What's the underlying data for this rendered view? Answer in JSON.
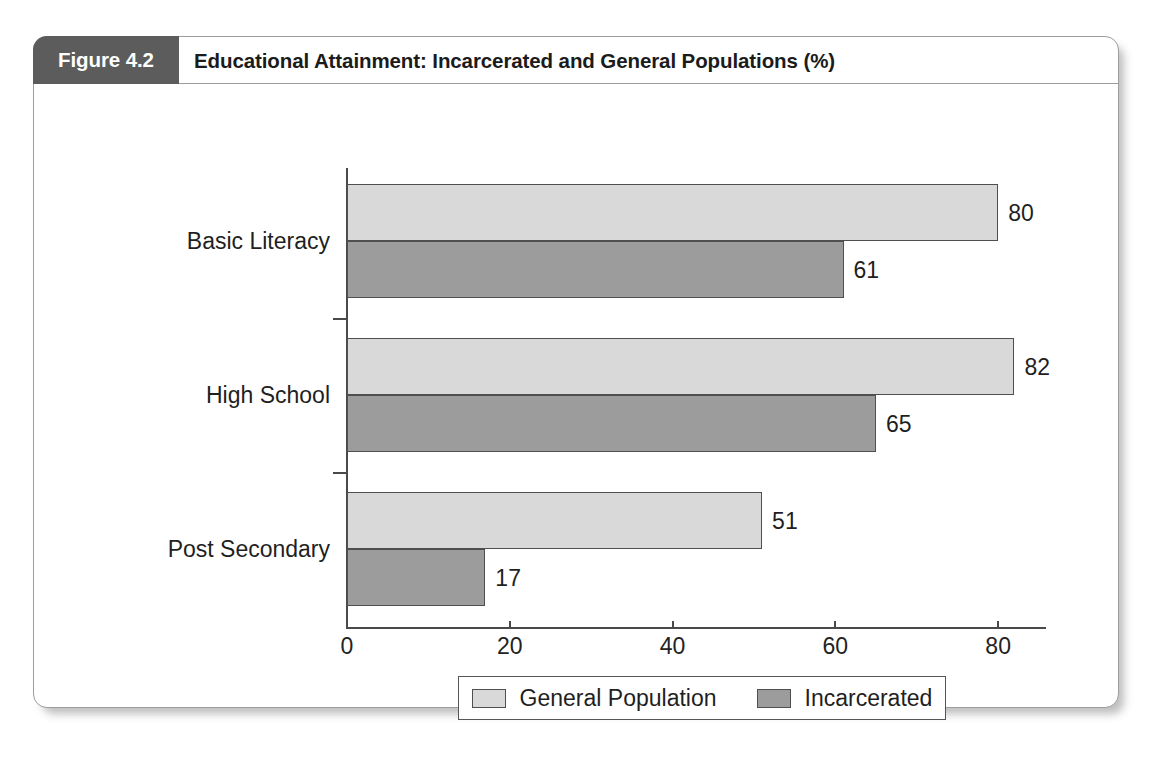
{
  "figure": {
    "tag": "Figure 4.2",
    "title": "Educational Attainment: Incarcerated and General Populations (%)"
  },
  "chart_data": {
    "type": "bar",
    "orientation": "horizontal",
    "title": "Educational Attainment: Incarcerated and General Populations (%)",
    "xlabel": "",
    "ylabel": "",
    "xlim": [
      0,
      86
    ],
    "xticks": [
      0,
      20,
      40,
      60,
      80
    ],
    "xtick_labels": [
      "0",
      "20",
      "40",
      "60",
      "80"
    ],
    "grid": false,
    "legend_position": "bottom-center",
    "categories": [
      "Basic Literacy",
      "High School",
      "Post Secondary"
    ],
    "series": [
      {
        "name": "General Population",
        "color": "#d9d9d9",
        "values": [
          80,
          82,
          51
        ],
        "labels": [
          "80",
          "82",
          "51"
        ]
      },
      {
        "name": "Incarcerated",
        "color": "#9c9c9c",
        "values": [
          61,
          65,
          17
        ],
        "labels": [
          "61",
          "65",
          "17"
        ]
      }
    ]
  },
  "colors": {
    "tag_background": "#5c5c5c",
    "tag_text": "#ffffff",
    "series_general": "#d9d9d9",
    "series_incarcerated": "#9c9c9c",
    "axis": "#4a4a4a",
    "card_border": "#9d9d9d"
  }
}
